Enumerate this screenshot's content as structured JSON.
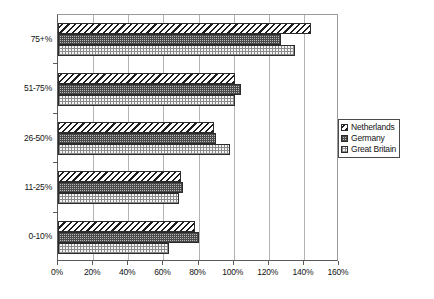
{
  "chart_data": {
    "type": "bar",
    "orientation": "horizontal",
    "title": "",
    "subtitle": "",
    "xlabel": "",
    "ylabel": "",
    "categories": [
      "0-10%",
      "11-25%",
      "26-50%",
      "51-75%",
      "75+%"
    ],
    "category_order_top_to_bottom": [
      "75+%",
      "51-75%",
      "26-50%",
      "11-25%",
      "0-10%"
    ],
    "series": [
      {
        "name": "Netherlands",
        "pattern": "diagonal-hatch",
        "values": [
          78,
          70,
          89,
          101,
          144
        ]
      },
      {
        "name": "Germany",
        "pattern": "dense-crosshatch",
        "values": [
          80,
          71,
          90,
          104,
          127
        ]
      },
      {
        "name": "Great Britain",
        "pattern": "light-dotted",
        "values": [
          63,
          69,
          98,
          101,
          135
        ]
      }
    ],
    "xlim": [
      0,
      160
    ],
    "xtick_values": [
      0,
      20,
      40,
      60,
      80,
      100,
      120,
      140,
      160
    ],
    "xtick_labels": [
      "0%",
      "20%",
      "40%",
      "60%",
      "80%",
      "100%",
      "120%",
      "140%",
      "160%"
    ],
    "grid": true,
    "grid_axis": "x",
    "legend_position": "right",
    "legend_entries": [
      "Netherlands",
      "Germany",
      "Great Britain"
    ],
    "value_unit": "%"
  },
  "legend": {
    "items": [
      {
        "label": "Netherlands"
      },
      {
        "label": "Germany"
      },
      {
        "label": "Great Britain"
      }
    ]
  },
  "axes": {
    "x": {
      "ticks": [
        {
          "label": "0%",
          "value": 0
        },
        {
          "label": "20%",
          "value": 20
        },
        {
          "label": "40%",
          "value": 40
        },
        {
          "label": "60%",
          "value": 60
        },
        {
          "label": "80%",
          "value": 80
        },
        {
          "label": "100%",
          "value": 100
        },
        {
          "label": "120%",
          "value": 120
        },
        {
          "label": "140%",
          "value": 140
        },
        {
          "label": "160%",
          "value": 160
        }
      ]
    },
    "y": {
      "ticks": [
        {
          "label": "75+%"
        },
        {
          "label": "51-75%"
        },
        {
          "label": "26-50%"
        },
        {
          "label": "11-25%"
        },
        {
          "label": "0-10%"
        }
      ]
    }
  },
  "colors": {
    "axis": "#5a5a5a",
    "grid": "#b4b4b4",
    "bar_outline": "#2b2b2b",
    "text": "#141414",
    "background": "#ffffff"
  }
}
